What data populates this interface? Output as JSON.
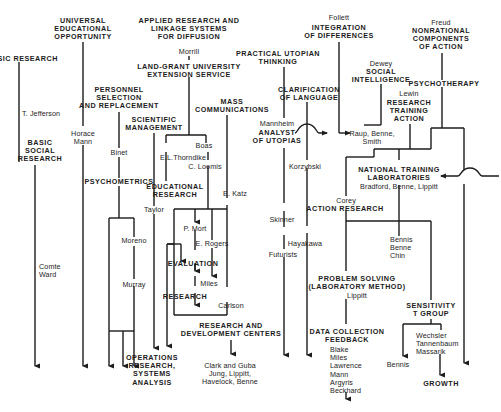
{
  "diagram": {
    "type": "genealogy-flow-diagram",
    "nodes": {
      "basic_research": "BASIC RESEARCH",
      "t_jefferson": "T. Jefferson",
      "basic_social_research": "BASIC\nSOCIAL\nRESEARCH",
      "comte_ward": "Comte\nWard",
      "universal_ed": "UNIVERSAL\nEDUCATIONAL\nOPPORTUNITY",
      "horace_mann": "Horace\nMann",
      "personnel": "PERSONNEL\nSELECTION\nAND REPLACEMENT",
      "binet": "Binet",
      "psychometrics": "PSYCHOMETRICS",
      "moreno": "Moreno",
      "murray": "Murray",
      "scientific_mgmt": "SCIENTIFIC\nMANAGEMENT",
      "taylor": "Taylor",
      "operations_research": "OPERATIONS\nRESEARCH,\nSYSTEMS\nANALYSIS",
      "applied_research": "APPLIED RESEARCH AND\nLINKAGE SYSTEMS\nFOR DIFFUSION",
      "morrill": "Morrill",
      "land_grant": "LAND-GRANT UNIVERSITY\nEXTENSION SERVICE",
      "boas": "Boas",
      "thorndike": "E.L.Thorndike",
      "c_loomis": "C. Loomis",
      "educational_research": "EDUCATIONAL\nRESEARCH",
      "e_katz": "E. Katz",
      "mass_comm": "MASS\nCOMMUNICATIONS",
      "p_mort": "P. Mort",
      "e_rogers": "E. Rogers",
      "evaluation": "EVALUATION",
      "miles": "Miles",
      "research": "RESEARCH",
      "carlson": "Carlson",
      "rd_centers": "RESEARCH AND\nDEVELOPMENT CENTERS",
      "clark_guba": "Clark and Guba\nJung, Lippitt,\nHavelock, Benne",
      "practical_utopian": "PRACTICAL UTOPIAN\nTHINKING",
      "clarification": "CLARIFICATION\nOF LANGUAGE",
      "mannheim": "Mannheim",
      "analyst_utopias": "ANALYST\nOF UTOPIAS",
      "korzybski": "Korzybski",
      "skinner": "Skinner",
      "hayakawa": "Hayakawa",
      "futurists": "Futurists",
      "follett": "Follett",
      "integration": "INTEGRATION\nOF DIFFERENCES",
      "dewey": "Dewey",
      "social_intelligence": "SOCIAL\nINTELLIGENCE",
      "raup": "Raup, Benne,\nSmith",
      "lewin": "Lewin",
      "research_training_action": "RESEARCH\nTRAINING\nACTION",
      "freud": "Freud",
      "nonrational": "NONRATIONAL\nCOMPONENTS\nOF ACTION",
      "psychotherapy": "PSYCHOTHERAPY",
      "ntl": "NATIONAL TRAINING\nLABORATORIES",
      "ntl_names": "Bradford, Benne, Lippitt",
      "corey": "Corey",
      "action_research": "ACTION RESEARCH",
      "bennis_benne_chin": "Bennis\nBenne\nChin",
      "problem_solving": "PROBLEM SOLVING\n(LABORATORY METHOD)",
      "lippitt": "Lippitt",
      "data_collection": "DATA COLLECTION\nFEEDBACK",
      "data_names": "Blake\nMiles\nLawrence\nMann\nArgyris\nBeckhard",
      "sensitivity": "SENSITIVITY\nT GROUP",
      "bennis": "Bennis",
      "wechsler": "Wechsler\nTannenbaum\nMassarik",
      "growth": "GROWTH"
    },
    "line_color": "#1c1c1c"
  }
}
